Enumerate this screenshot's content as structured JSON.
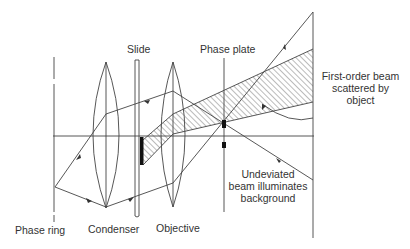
{
  "diagram": {
    "labels": {
      "slide": "Slide",
      "phase_plate": "Phase plate",
      "first_order": [
        "First-order beam",
        "scattered by",
        "object"
      ],
      "phase_ring": "Phase ring",
      "condenser": "Condenser",
      "objective": "Objective",
      "undeviated": [
        "Undeviated",
        "beam illuminates",
        "background"
      ]
    },
    "colors": {
      "line": "#444444",
      "fill_dark": "#111111",
      "background": "#ffffff"
    }
  }
}
